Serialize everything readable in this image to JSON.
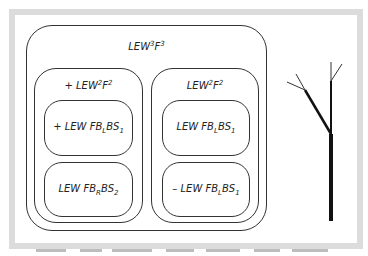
{
  "diagram": {
    "outer": {
      "label_base": "LEW",
      "label_sup1": "3",
      "label_mid": "F",
      "label_sup2": "3"
    },
    "left_group": {
      "label_prefix": "+ LEW",
      "label_sup1": "2",
      "label_mid": "F",
      "label_sup2": "2",
      "top": {
        "prefix": "+ LEW FB",
        "sub1": "L",
        "mid": "BS",
        "sub2": "1"
      },
      "bottom": {
        "prefix": "LEW FB",
        "sub1": "R",
        "mid": "BS",
        "sub2": "2"
      }
    },
    "right_group": {
      "label_prefix": "LEW",
      "label_sup1": "2",
      "label_mid": "F",
      "label_sup2": "2",
      "top": {
        "prefix": "LEW FB",
        "sub1": "L",
        "mid": "BS",
        "sub2": "1"
      },
      "bottom": {
        "prefix": "– LEW FB",
        "sub1": "L",
        "mid": "BS",
        "sub2": "1"
      }
    },
    "tree_icon": "branching-tree"
  },
  "colors": {
    "frame": "#dcdcdc",
    "line": "#333333",
    "tree": "#111111"
  }
}
